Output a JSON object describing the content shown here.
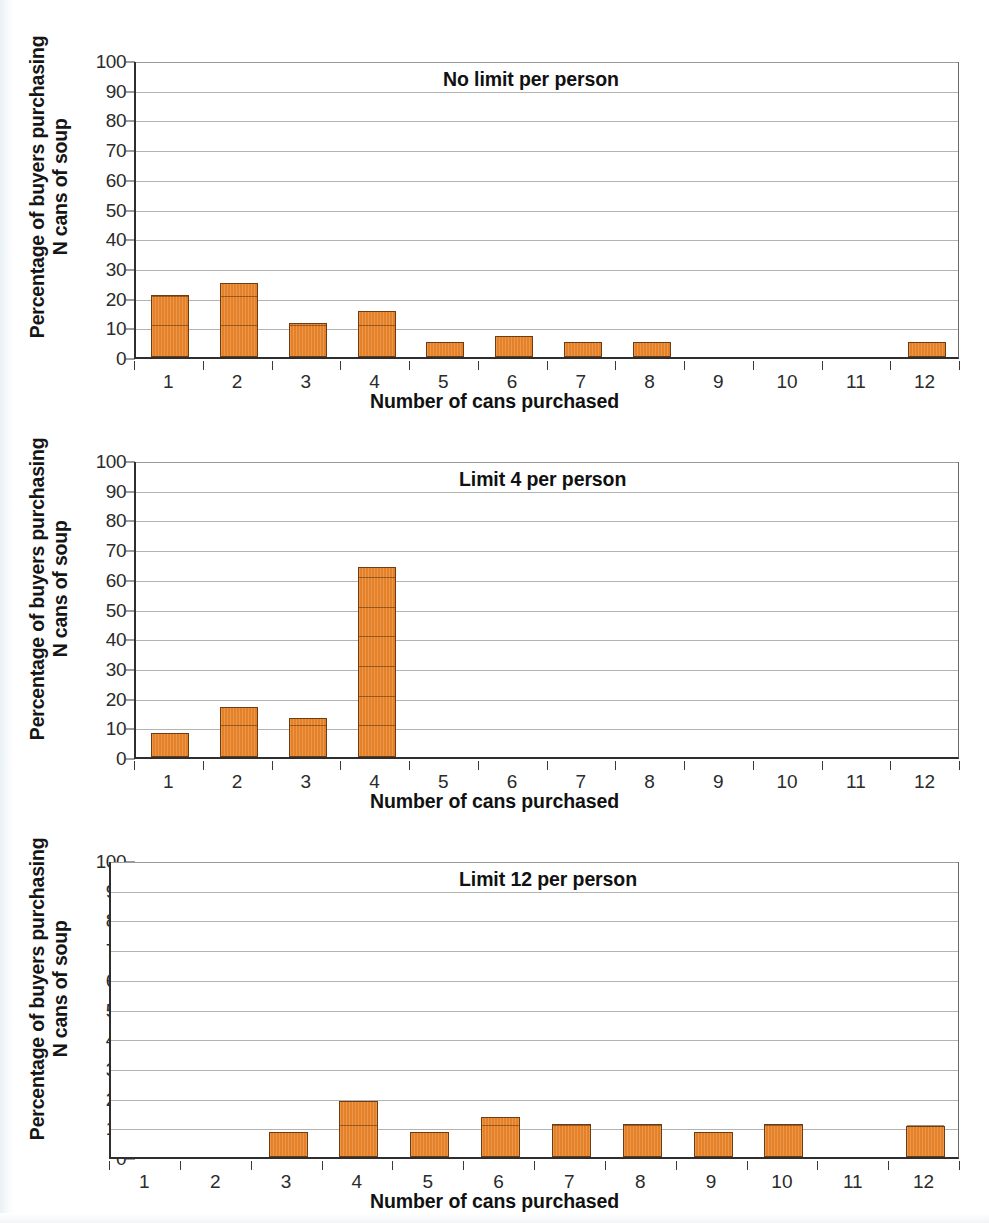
{
  "figure": {
    "background_color": "#ffffff",
    "bar_color": "#e8842a",
    "bar_border_color": "#6d3c12",
    "grid_color": "#b3b3b3",
    "axis_color": "#2e2e2e"
  },
  "shared": {
    "ylabel_line1": "Percentage of buyers purchasing",
    "ylabel_line2": "N cans of soup",
    "xlabel": "Number of cans purchased",
    "ytick_labels": [
      "100",
      "90",
      "80",
      "70",
      "60",
      "50",
      "40",
      "30",
      "20",
      "10",
      "0"
    ],
    "xtick_labels": [
      "1",
      "2",
      "3",
      "4",
      "5",
      "6",
      "7",
      "8",
      "9",
      "10",
      "11",
      "12"
    ]
  },
  "chart_data": [
    {
      "type": "bar",
      "title": "No limit per person",
      "xlabel": "Number of cans purchased",
      "ylabel": "Percentage of buyers purchasing N cans of soup",
      "categories": [
        "1",
        "2",
        "3",
        "4",
        "5",
        "6",
        "7",
        "8",
        "9",
        "10",
        "11",
        "12"
      ],
      "values": [
        21,
        25,
        11.5,
        15.5,
        5,
        7,
        5,
        5,
        0,
        0,
        0,
        5
      ],
      "ylim": [
        0,
        100
      ],
      "ytick_step": 10,
      "grid": true,
      "legend": "none"
    },
    {
      "type": "bar",
      "title": "Limit 4 per person",
      "xlabel": "Number of cans purchased",
      "ylabel": "Percentage of buyers purchasing N cans of soup",
      "categories": [
        "1",
        "2",
        "3",
        "4",
        "5",
        "6",
        "7",
        "8",
        "9",
        "10",
        "11",
        "12"
      ],
      "values": [
        8,
        17,
        13,
        64,
        0,
        0,
        0,
        0,
        0,
        0,
        0,
        0
      ],
      "ylim": [
        0,
        100
      ],
      "ytick_step": 10,
      "grid": true,
      "legend": "none"
    },
    {
      "type": "bar",
      "title": "Limit 12 per person",
      "xlabel": "Number of cans purchased",
      "ylabel": "Percentage of buyers purchasing N cans of soup",
      "categories": [
        "1",
        "2",
        "3",
        "4",
        "5",
        "6",
        "7",
        "8",
        "9",
        "10",
        "11",
        "12"
      ],
      "values": [
        0,
        0,
        8.5,
        19,
        8.5,
        13.5,
        11,
        11,
        8.5,
        11,
        0,
        10.5
      ],
      "ylim": [
        0,
        100
      ],
      "ytick_step": 10,
      "grid": true,
      "legend": "none"
    }
  ]
}
